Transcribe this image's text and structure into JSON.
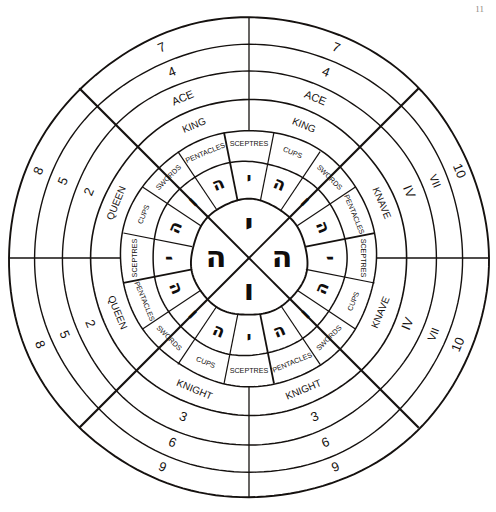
{
  "diagram": {
    "geometry": {
      "center_x": 249,
      "center_y": 258,
      "radii": {
        "inner_circle": 58,
        "ring_letters_outer": 97,
        "ring_suits_outer": 128,
        "ring_court_outer": 158,
        "ring_num1_outer": 187,
        "ring_num2_outer": 214,
        "ring_num3_outer": 240
      },
      "ink_color": "#15110f",
      "background": "#ffffff"
    },
    "center": {
      "name": "tetragrammaton",
      "letters": [
        {
          "position": "top",
          "glyph": "י",
          "name": "yod"
        },
        {
          "position": "right",
          "glyph": "ה",
          "name": "heh"
        },
        {
          "position": "bottom",
          "glyph": "ו",
          "name": "vav"
        },
        {
          "position": "left",
          "glyph": "ה",
          "name": "heh-final"
        }
      ]
    },
    "ring_letters": {
      "name": "hebrew-letter-ring",
      "cells": [
        {
          "index": 0,
          "glyph": "י"
        },
        {
          "index": 1,
          "glyph": "ה"
        },
        {
          "index": 2,
          "glyph": "ו"
        },
        {
          "index": 3,
          "glyph": "ה"
        },
        {
          "index": 4,
          "glyph": "י"
        },
        {
          "index": 5,
          "glyph": "ה"
        },
        {
          "index": 6,
          "glyph": "ו"
        },
        {
          "index": 7,
          "glyph": "ה"
        },
        {
          "index": 8,
          "glyph": "י"
        },
        {
          "index": 9,
          "glyph": "ה"
        },
        {
          "index": 10,
          "glyph": "ו"
        },
        {
          "index": 11,
          "glyph": "ה"
        },
        {
          "index": 12,
          "glyph": "י"
        },
        {
          "index": 13,
          "glyph": "ה"
        },
        {
          "index": 14,
          "glyph": "ו"
        },
        {
          "index": 15,
          "glyph": "ה"
        }
      ]
    },
    "ring_suits": {
      "name": "suit-ring",
      "labels": [
        "SCEPTRES",
        "CUPS",
        "SWORDS",
        "PENTACLES",
        "SCEPTRES",
        "CUPS",
        "SWORDS",
        "PENTACLES",
        "SCEPTRES",
        "CUPS",
        "SWORDS",
        "PENTACLES",
        "SCEPTRES",
        "CUPS",
        "SWORDS",
        "PENTACLES"
      ]
    },
    "ring_court": {
      "name": "court-card-ring",
      "quadrants": [
        {
          "position": "top",
          "label": "KING"
        },
        {
          "position": "right",
          "label": "KNAVE"
        },
        {
          "position": "bottom",
          "label": "KNIGHT"
        },
        {
          "position": "left",
          "label": "QUEEN"
        }
      ]
    },
    "ring_numbers": {
      "name": "number-rings",
      "quadrants": [
        {
          "position": "top",
          "values": [
            "ACE",
            "4",
            "7"
          ]
        },
        {
          "position": "right",
          "values": [
            "IV",
            "VII",
            "10"
          ]
        },
        {
          "position": "bottom",
          "values": [
            "3",
            "6",
            "9"
          ]
        },
        {
          "position": "left",
          "values": [
            "2",
            "5",
            "8"
          ]
        }
      ]
    },
    "page_marks": {
      "top_right": "11"
    }
  }
}
